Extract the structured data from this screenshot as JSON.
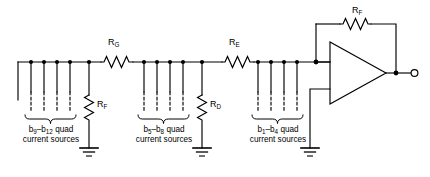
{
  "diagram": {
    "line_color": "#000000",
    "background": "#ffffff"
  },
  "series_resistors": [
    {
      "name": "resistor-rg",
      "label_main": "R",
      "label_sub": "G"
    },
    {
      "name": "resistor-re",
      "label_main": "R",
      "label_sub": "E"
    }
  ],
  "shunt_resistors": [
    {
      "name": "resistor-rf-shunt",
      "label_main": "R",
      "label_sub": "F"
    },
    {
      "name": "resistor-rd-shunt",
      "label_main": "R",
      "label_sub": "D"
    }
  ],
  "feedback_resistor": {
    "name": "resistor-rf-feedback",
    "label_main": "R",
    "label_sub": "F"
  },
  "current_source_groups": [
    {
      "id": "group-b9-b12",
      "range_prefix": "b",
      "range_start_sub": "9",
      "range_dash": "–",
      "range_end_prefix": "b",
      "range_end_sub": "12",
      "qualifier": "quad",
      "line2": "current sources",
      "count": 4
    },
    {
      "id": "group-b5-b8",
      "range_prefix": "b",
      "range_start_sub": "5",
      "range_dash": "–",
      "range_end_prefix": "b",
      "range_end_sub": "8",
      "qualifier": "quad",
      "line2": "current sources",
      "count": 4
    },
    {
      "id": "group-b1-b4",
      "range_prefix": "b",
      "range_start_sub": "1",
      "range_dash": "–",
      "range_end_prefix": "b",
      "range_end_sub": "4",
      "qualifier": "quad",
      "line2": "current sources",
      "count": 4
    }
  ],
  "opamp": {
    "name": "operational-amplifier",
    "label": ""
  },
  "output_terminal": {
    "name": "output-terminal",
    "label": ""
  },
  "grounds": [
    {
      "name": "ground-rf"
    },
    {
      "name": "ground-rd"
    },
    {
      "name": "ground-opamp-noninverting"
    }
  ]
}
